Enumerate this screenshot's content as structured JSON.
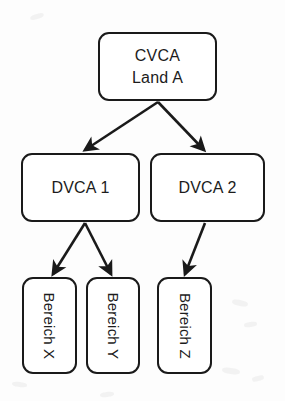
{
  "diagram": {
    "type": "tree",
    "background_color": "#fdfdfd",
    "node_fill_color": "#ffffff",
    "node_border_color": "#1a1a1a",
    "edge_color": "#1a1a1a",
    "text_color": "#1c1c1c",
    "levels": [
      {
        "level": 1,
        "nodes": [
          {
            "id": "cvca",
            "label": "CVCA\nLand A",
            "line1": "CVCA",
            "line2": "Land A",
            "orientation": "horizontal",
            "x": 98,
            "y": 32,
            "width": 119,
            "height": 69
          }
        ]
      },
      {
        "level": 2,
        "nodes": [
          {
            "id": "dvca1",
            "label": "DVCA 1",
            "orientation": "horizontal",
            "x": 21,
            "y": 153,
            "width": 119,
            "height": 69
          },
          {
            "id": "dvca2",
            "label": "DVCA 2",
            "orientation": "horizontal",
            "x": 150,
            "y": 153,
            "width": 115,
            "height": 69
          }
        ]
      },
      {
        "level": 3,
        "nodes": [
          {
            "id": "bereich-x",
            "label": "Bereich X",
            "orientation": "vertical",
            "x": 22,
            "y": 277,
            "width": 55,
            "height": 97
          },
          {
            "id": "bereich-y",
            "label": "Bereich Y",
            "orientation": "vertical",
            "x": 86,
            "y": 277,
            "width": 54,
            "height": 97
          },
          {
            "id": "bereich-z",
            "label": "Bereich Z",
            "orientation": "vertical",
            "x": 157,
            "y": 277,
            "width": 55,
            "height": 97
          }
        ]
      }
    ],
    "edges": [
      {
        "id": "cvca-to-dvca1",
        "from": "cvca",
        "to": "dvca1",
        "x1": 158,
        "y1": 102,
        "x2": 85,
        "y2": 150
      },
      {
        "id": "cvca-to-dvca2",
        "from": "cvca",
        "to": "dvca2",
        "x1": 158,
        "y1": 102,
        "x2": 204,
        "y2": 150
      },
      {
        "id": "dvca1-to-bereich-x",
        "from": "dvca1",
        "to": "bereich-x",
        "x1": 85,
        "y1": 223,
        "x2": 53,
        "y2": 274
      },
      {
        "id": "dvca1-to-bereich-y",
        "from": "dvca1",
        "to": "bereich-y",
        "x1": 85,
        "y1": 223,
        "x2": 111,
        "y2": 274
      },
      {
        "id": "dvca2-to-bereich-z",
        "from": "dvca2",
        "to": "bereich-z",
        "x1": 205,
        "y1": 223,
        "x2": 185,
        "y2": 274
      }
    ]
  }
}
